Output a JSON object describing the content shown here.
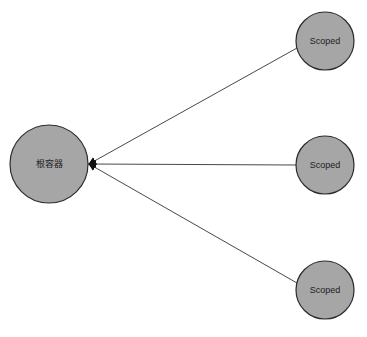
{
  "diagram": {
    "colors": {
      "node_fill": "#a6a6a6",
      "node_stroke": "#2b2b2b",
      "edge": "#333333",
      "background": "#ffffff"
    },
    "root": {
      "label": "根容器",
      "cx": 49,
      "cy": 164,
      "r": 39
    },
    "children": [
      {
        "label": "Scoped",
        "cx": 325,
        "cy": 41,
        "r": 29
      },
      {
        "label": "Scoped",
        "cx": 325,
        "cy": 165,
        "r": 29
      },
      {
        "label": "Scoped",
        "cx": 325,
        "cy": 290,
        "r": 29
      }
    ],
    "edges": [
      {
        "from": "Scoped (top)",
        "to": "根容器",
        "arrow": "to-root"
      },
      {
        "from": "Scoped (middle)",
        "to": "根容器",
        "arrow": "to-root"
      },
      {
        "from": "Scoped (bottom)",
        "to": "根容器",
        "arrow": "to-root"
      }
    ]
  }
}
